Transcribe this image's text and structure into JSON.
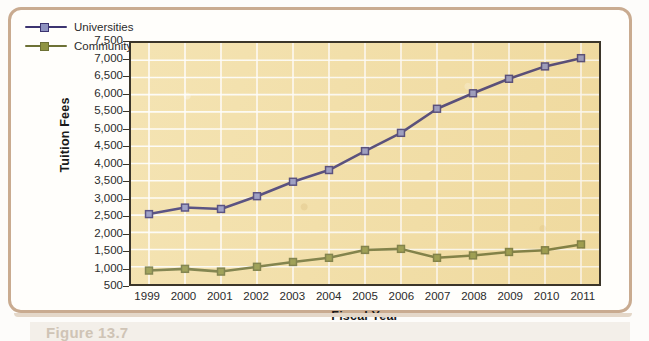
{
  "figure": {
    "caption": "Figure 13.7"
  },
  "chart_data": {
    "type": "line",
    "title": "",
    "xlabel": "Fiscal Year",
    "ylabel": "Tuition Fees",
    "x": [
      1999,
      2000,
      2001,
      2002,
      2003,
      2004,
      2005,
      2006,
      2007,
      2008,
      2009,
      2010,
      2011
    ],
    "categories": [
      "1999",
      "2000",
      "2001",
      "2002",
      "2003",
      "2004",
      "2005",
      "2006",
      "2007",
      "2008",
      "2009",
      "2010",
      "2011"
    ],
    "ylim": [
      500,
      7500
    ],
    "yticks": [
      500,
      1000,
      1500,
      2000,
      2500,
      3000,
      3500,
      4000,
      4500,
      5000,
      5500,
      6000,
      6500,
      7000,
      7500
    ],
    "ytick_labels": [
      "500",
      "1,000",
      "1,500",
      "2,000",
      "2,500",
      "3,000",
      "3,500",
      "4,000",
      "4,500",
      "5,000",
      "5,500",
      "6,000",
      "6,500",
      "7,000",
      "7,500"
    ],
    "grid": true,
    "grid_color": "#ffffff",
    "plot_background": "#f2dea4",
    "legend_position": "top-left",
    "series": [
      {
        "name": "Universities",
        "color": "#3c3470",
        "marker_color": "#8e92c0",
        "marker": "square",
        "values": [
          2530,
          2720,
          2680,
          3050,
          3470,
          3810,
          4360,
          4890,
          5590,
          6040,
          6460,
          6820,
          7060
        ]
      },
      {
        "name": "Community Colleges",
        "color": "#6d7135",
        "marker_color": "#8f9442",
        "marker": "square",
        "values": [
          890,
          940,
          860,
          1000,
          1140,
          1260,
          1490,
          1520,
          1260,
          1330,
          1430,
          1480,
          1650
        ]
      }
    ]
  },
  "colors": {
    "frame_border": "#c9ab90",
    "axis": "#3b3529",
    "text": "#2b2b2b",
    "universities": "#3c3470",
    "community_colleges": "#6d7135"
  }
}
